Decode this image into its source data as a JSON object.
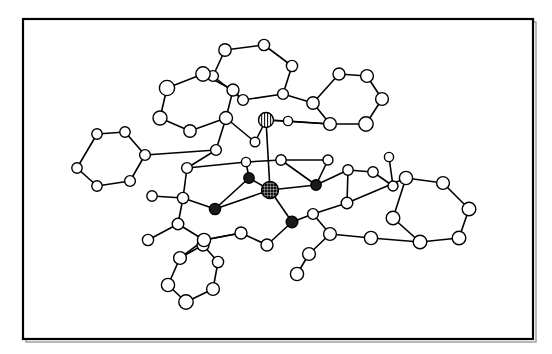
{
  "figure": {
    "type": "molecular-structure-diagram",
    "title": "",
    "caption": "",
    "background_color": "#ffffff",
    "line_color": "#000000",
    "atom_fill_light": "#ffffff",
    "atom_fill_dark": "#1a1a1a",
    "atom_stroke": "#000000"
  },
  "frame": {
    "x": 23,
    "y": 19,
    "width": 510,
    "height": 320,
    "stroke_width": 2.2,
    "shadow_color": "#9a9a9a"
  },
  "chart_data": {
    "type": "scatter",
    "title": "",
    "xlabel": "",
    "ylabel": "",
    "xlim": [
      23,
      533
    ],
    "ylim": [
      19,
      339
    ],
    "grid": false,
    "legend": "",
    "atom_classes": [
      {
        "name": "carbon-light",
        "fill": "#ffffff",
        "stroke": "#000000",
        "pattern": "none"
      },
      {
        "name": "heteroatom-dark",
        "fill": "#1a1a1a",
        "stroke": "#000000",
        "pattern": "solid"
      },
      {
        "name": "metal-hatched",
        "fill": "#1a1a1a",
        "stroke": "#000000",
        "pattern": "crosshatch"
      },
      {
        "name": "metal-striped",
        "fill": "#ffffff",
        "stroke": "#000000",
        "pattern": "vertical-stripe"
      }
    ],
    "atoms": [
      {
        "id": "M1",
        "x": 270,
        "y": 190,
        "r": 8.5,
        "cls": "metal-hatched"
      },
      {
        "id": "M2",
        "x": 266,
        "y": 120,
        "r": 7.5,
        "cls": "metal-striped"
      },
      {
        "id": "D1",
        "x": 249,
        "y": 178,
        "r": 5.2,
        "cls": "heteroatom-dark"
      },
      {
        "id": "D2",
        "x": 316,
        "y": 185,
        "r": 5.2,
        "cls": "heteroatom-dark"
      },
      {
        "id": "D3",
        "x": 215,
        "y": 209,
        "r": 5.6,
        "cls": "heteroatom-dark"
      },
      {
        "id": "D4",
        "x": 292,
        "y": 222,
        "r": 5.8,
        "cls": "heteroatom-dark"
      },
      {
        "id": "A1",
        "x": 225,
        "y": 50,
        "r": 6.2,
        "cls": "carbon-light"
      },
      {
        "id": "A2",
        "x": 264,
        "y": 45,
        "r": 5.6,
        "cls": "carbon-light"
      },
      {
        "id": "A3",
        "x": 292,
        "y": 66,
        "r": 5.6,
        "cls": "carbon-light"
      },
      {
        "id": "A4",
        "x": 283,
        "y": 94,
        "r": 5.4,
        "cls": "carbon-light"
      },
      {
        "id": "A5",
        "x": 243,
        "y": 100,
        "r": 5.4,
        "cls": "carbon-light"
      },
      {
        "id": "A6",
        "x": 213,
        "y": 76,
        "r": 5.4,
        "cls": "carbon-light"
      },
      {
        "id": "B1",
        "x": 203,
        "y": 74,
        "r": 7.2,
        "cls": "carbon-light"
      },
      {
        "id": "B2",
        "x": 167,
        "y": 88,
        "r": 7.6,
        "cls": "carbon-light"
      },
      {
        "id": "B3",
        "x": 160,
        "y": 118,
        "r": 7.0,
        "cls": "carbon-light"
      },
      {
        "id": "B4",
        "x": 190,
        "y": 131,
        "r": 6.2,
        "cls": "carbon-light"
      },
      {
        "id": "B5",
        "x": 226,
        "y": 118,
        "r": 6.5,
        "cls": "carbon-light"
      },
      {
        "id": "B6",
        "x": 233,
        "y": 90,
        "r": 6.0,
        "cls": "carbon-light"
      },
      {
        "id": "C1",
        "x": 339,
        "y": 74,
        "r": 6.0,
        "cls": "carbon-light"
      },
      {
        "id": "C2",
        "x": 367,
        "y": 76,
        "r": 6.4,
        "cls": "carbon-light"
      },
      {
        "id": "C3",
        "x": 382,
        "y": 99,
        "r": 6.4,
        "cls": "carbon-light"
      },
      {
        "id": "C4",
        "x": 366,
        "y": 124,
        "r": 7.2,
        "cls": "carbon-light"
      },
      {
        "id": "C5",
        "x": 330,
        "y": 124,
        "r": 6.4,
        "cls": "carbon-light"
      },
      {
        "id": "C6",
        "x": 313,
        "y": 103,
        "r": 6.2,
        "cls": "carbon-light"
      },
      {
        "id": "E1",
        "x": 97,
        "y": 134,
        "r": 5.2,
        "cls": "carbon-light"
      },
      {
        "id": "E2",
        "x": 125,
        "y": 132,
        "r": 5.2,
        "cls": "carbon-light"
      },
      {
        "id": "E3",
        "x": 145,
        "y": 155,
        "r": 5.4,
        "cls": "carbon-light"
      },
      {
        "id": "E4",
        "x": 130,
        "y": 181,
        "r": 5.4,
        "cls": "carbon-light"
      },
      {
        "id": "E5",
        "x": 97,
        "y": 186,
        "r": 5.2,
        "cls": "carbon-light"
      },
      {
        "id": "E6",
        "x": 77,
        "y": 168,
        "r": 5.2,
        "cls": "carbon-light"
      },
      {
        "id": "F1",
        "x": 406,
        "y": 178,
        "r": 6.6,
        "cls": "carbon-light"
      },
      {
        "id": "F2",
        "x": 443,
        "y": 183,
        "r": 6.4,
        "cls": "carbon-light"
      },
      {
        "id": "F3",
        "x": 469,
        "y": 209,
        "r": 6.8,
        "cls": "carbon-light"
      },
      {
        "id": "F4",
        "x": 459,
        "y": 238,
        "r": 6.8,
        "cls": "carbon-light"
      },
      {
        "id": "F5",
        "x": 420,
        "y": 242,
        "r": 6.8,
        "cls": "carbon-light"
      },
      {
        "id": "F6",
        "x": 393,
        "y": 218,
        "r": 6.8,
        "cls": "carbon-light"
      },
      {
        "id": "G1",
        "x": 203,
        "y": 245,
        "r": 6.0,
        "cls": "carbon-light"
      },
      {
        "id": "G2",
        "x": 218,
        "y": 262,
        "r": 5.6,
        "cls": "carbon-light"
      },
      {
        "id": "G3",
        "x": 213,
        "y": 289,
        "r": 6.4,
        "cls": "carbon-light"
      },
      {
        "id": "G4",
        "x": 186,
        "y": 302,
        "r": 7.2,
        "cls": "carbon-light"
      },
      {
        "id": "G5",
        "x": 168,
        "y": 285,
        "r": 6.6,
        "cls": "carbon-light"
      },
      {
        "id": "G6",
        "x": 180,
        "y": 258,
        "r": 6.4,
        "cls": "carbon-light"
      },
      {
        "id": "H1",
        "x": 216,
        "y": 150,
        "r": 5.4,
        "cls": "carbon-light"
      },
      {
        "id": "H2",
        "x": 255,
        "y": 142,
        "r": 4.8,
        "cls": "carbon-light"
      },
      {
        "id": "H3",
        "x": 288,
        "y": 121,
        "r": 4.6,
        "cls": "carbon-light"
      },
      {
        "id": "H4",
        "x": 281,
        "y": 160,
        "r": 5.2,
        "cls": "carbon-light"
      },
      {
        "id": "H5",
        "x": 246,
        "y": 162,
        "r": 4.6,
        "cls": "carbon-light"
      },
      {
        "id": "H6",
        "x": 187,
        "y": 168,
        "r": 5.4,
        "cls": "carbon-light"
      },
      {
        "id": "H7",
        "x": 183,
        "y": 198,
        "r": 5.6,
        "cls": "carbon-light"
      },
      {
        "id": "H8",
        "x": 152,
        "y": 196,
        "r": 5.2,
        "cls": "carbon-light"
      },
      {
        "id": "H9",
        "x": 178,
        "y": 224,
        "r": 5.8,
        "cls": "carbon-light"
      },
      {
        "id": "H10",
        "x": 148,
        "y": 240,
        "r": 5.6,
        "cls": "carbon-light"
      },
      {
        "id": "H11",
        "x": 204,
        "y": 240,
        "r": 6.6,
        "cls": "carbon-light"
      },
      {
        "id": "H12",
        "x": 241,
        "y": 233,
        "r": 6.0,
        "cls": "carbon-light"
      },
      {
        "id": "H13",
        "x": 267,
        "y": 245,
        "r": 6.0,
        "cls": "carbon-light"
      },
      {
        "id": "H14",
        "x": 313,
        "y": 214,
        "r": 5.4,
        "cls": "carbon-light"
      },
      {
        "id": "H15",
        "x": 330,
        "y": 234,
        "r": 6.4,
        "cls": "carbon-light"
      },
      {
        "id": "H16",
        "x": 309,
        "y": 254,
        "r": 6.4,
        "cls": "carbon-light"
      },
      {
        "id": "H17",
        "x": 297,
        "y": 274,
        "r": 6.6,
        "cls": "carbon-light"
      },
      {
        "id": "H18",
        "x": 371,
        "y": 238,
        "r": 6.6,
        "cls": "carbon-light"
      },
      {
        "id": "H19",
        "x": 347,
        "y": 203,
        "r": 5.8,
        "cls": "carbon-light"
      },
      {
        "id": "H20",
        "x": 373,
        "y": 172,
        "r": 5.2,
        "cls": "carbon-light"
      },
      {
        "id": "H21",
        "x": 389,
        "y": 157,
        "r": 4.6,
        "cls": "carbon-light"
      },
      {
        "id": "H22",
        "x": 348,
        "y": 170,
        "r": 5.2,
        "cls": "carbon-light"
      },
      {
        "id": "H23",
        "x": 393,
        "y": 186,
        "r": 5.0,
        "cls": "carbon-light"
      },
      {
        "id": "H24",
        "x": 328,
        "y": 160,
        "r": 5.0,
        "cls": "carbon-light"
      }
    ],
    "bonds": [
      [
        "A1",
        "A2"
      ],
      [
        "A2",
        "A3"
      ],
      [
        "A3",
        "A4"
      ],
      [
        "A4",
        "A5"
      ],
      [
        "A5",
        "A6"
      ],
      [
        "A6",
        "A1"
      ],
      [
        "B1",
        "B2"
      ],
      [
        "B2",
        "B3"
      ],
      [
        "B3",
        "B4"
      ],
      [
        "B4",
        "B5"
      ],
      [
        "B5",
        "B6"
      ],
      [
        "B6",
        "B1"
      ],
      [
        "C1",
        "C2"
      ],
      [
        "C2",
        "C3"
      ],
      [
        "C3",
        "C4"
      ],
      [
        "C4",
        "C5"
      ],
      [
        "C5",
        "C6"
      ],
      [
        "C6",
        "C1"
      ],
      [
        "E1",
        "E2"
      ],
      [
        "E2",
        "E3"
      ],
      [
        "E3",
        "E4"
      ],
      [
        "E4",
        "E5"
      ],
      [
        "E5",
        "E6"
      ],
      [
        "E6",
        "E1"
      ],
      [
        "F1",
        "F2"
      ],
      [
        "F2",
        "F3"
      ],
      [
        "F3",
        "F4"
      ],
      [
        "F4",
        "F5"
      ],
      [
        "F5",
        "F6"
      ],
      [
        "F6",
        "F1"
      ],
      [
        "G1",
        "G2"
      ],
      [
        "G2",
        "G3"
      ],
      [
        "G3",
        "G4"
      ],
      [
        "G4",
        "G5"
      ],
      [
        "G5",
        "G6"
      ],
      [
        "G6",
        "G1"
      ],
      [
        "A5",
        "B6"
      ],
      [
        "A4",
        "C6"
      ],
      [
        "C5",
        "M2"
      ],
      [
        "C5",
        "H3"
      ],
      [
        "B5",
        "H1"
      ],
      [
        "B5",
        "H2"
      ],
      [
        "H2",
        "M2"
      ],
      [
        "M2",
        "H3"
      ],
      [
        "M2",
        "M1"
      ],
      [
        "H1",
        "E3"
      ],
      [
        "H1",
        "H6"
      ],
      [
        "H6",
        "H5"
      ],
      [
        "H5",
        "D1"
      ],
      [
        "H5",
        "H4"
      ],
      [
        "H4",
        "D2"
      ],
      [
        "H4",
        "H24"
      ],
      [
        "D1",
        "M1"
      ],
      [
        "D2",
        "M1"
      ],
      [
        "D3",
        "M1"
      ],
      [
        "D4",
        "M1"
      ],
      [
        "D1",
        "D3"
      ],
      [
        "D3",
        "H7"
      ],
      [
        "H6",
        "H7"
      ],
      [
        "H7",
        "H8"
      ],
      [
        "H7",
        "H9"
      ],
      [
        "H9",
        "H10"
      ],
      [
        "H9",
        "H11"
      ],
      [
        "H11",
        "G6"
      ],
      [
        "H11",
        "G1"
      ],
      [
        "H11",
        "H12"
      ],
      [
        "H12",
        "H13"
      ],
      [
        "H13",
        "D4"
      ],
      [
        "D4",
        "H14"
      ],
      [
        "H14",
        "H19"
      ],
      [
        "H14",
        "H15"
      ],
      [
        "H15",
        "H16"
      ],
      [
        "H16",
        "H17"
      ],
      [
        "H15",
        "H18"
      ],
      [
        "H18",
        "F5"
      ],
      [
        "H19",
        "F1"
      ],
      [
        "H19",
        "H22"
      ],
      [
        "H22",
        "D2"
      ],
      [
        "H22",
        "H20"
      ],
      [
        "H20",
        "H23"
      ],
      [
        "H23",
        "H21"
      ],
      [
        "H24",
        "D2"
      ],
      [
        "H12",
        "H11"
      ]
    ],
    "counts": {
      "total_atoms": 62,
      "light_atoms": 56,
      "dark_atoms": 4,
      "metal_atoms": 2,
      "aromatic_rings": 6
    }
  }
}
